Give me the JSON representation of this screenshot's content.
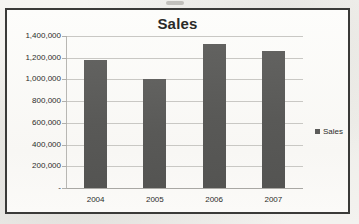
{
  "chart_data": {
    "type": "bar",
    "title": "Sales",
    "categories": [
      "2004",
      "2005",
      "2006",
      "2007"
    ],
    "values": [
      1180000,
      1000000,
      1330000,
      1265000
    ],
    "series": [
      {
        "name": "Sales",
        "values": [
          1180000,
          1000000,
          1330000,
          1265000
        ]
      }
    ],
    "xlabel": "",
    "ylabel": "",
    "ylim": [
      0,
      1400000
    ],
    "ytick_values": [
      1400000,
      1200000,
      1000000,
      800000,
      600000,
      400000,
      200000,
      0
    ],
    "ytick_labels": [
      "1,400,000",
      "1,200,000",
      "1,000,000",
      "800,000",
      "600,000",
      "400,000",
      "200,000",
      "-"
    ],
    "grid": true,
    "legend": {
      "position": "right",
      "entries": [
        "Sales"
      ]
    },
    "bar_color": "#5c5c5a",
    "gridline_color": "#c9c8c4",
    "frame_color": "#3a3a38"
  },
  "legend": {
    "label": "Sales",
    "swatch_name": "legend-swatch-sales"
  }
}
